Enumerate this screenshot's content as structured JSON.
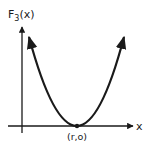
{
  "diagram": {
    "y_axis_label": "F",
    "y_axis_label_subscript": "3",
    "y_axis_label_suffix": "(x)",
    "x_axis_label": "x",
    "vertex_label": "(r,o)",
    "curve": "parabola",
    "vertex": {
      "x": "r",
      "y": "0"
    },
    "stroke_color": "#1a1a1a"
  }
}
